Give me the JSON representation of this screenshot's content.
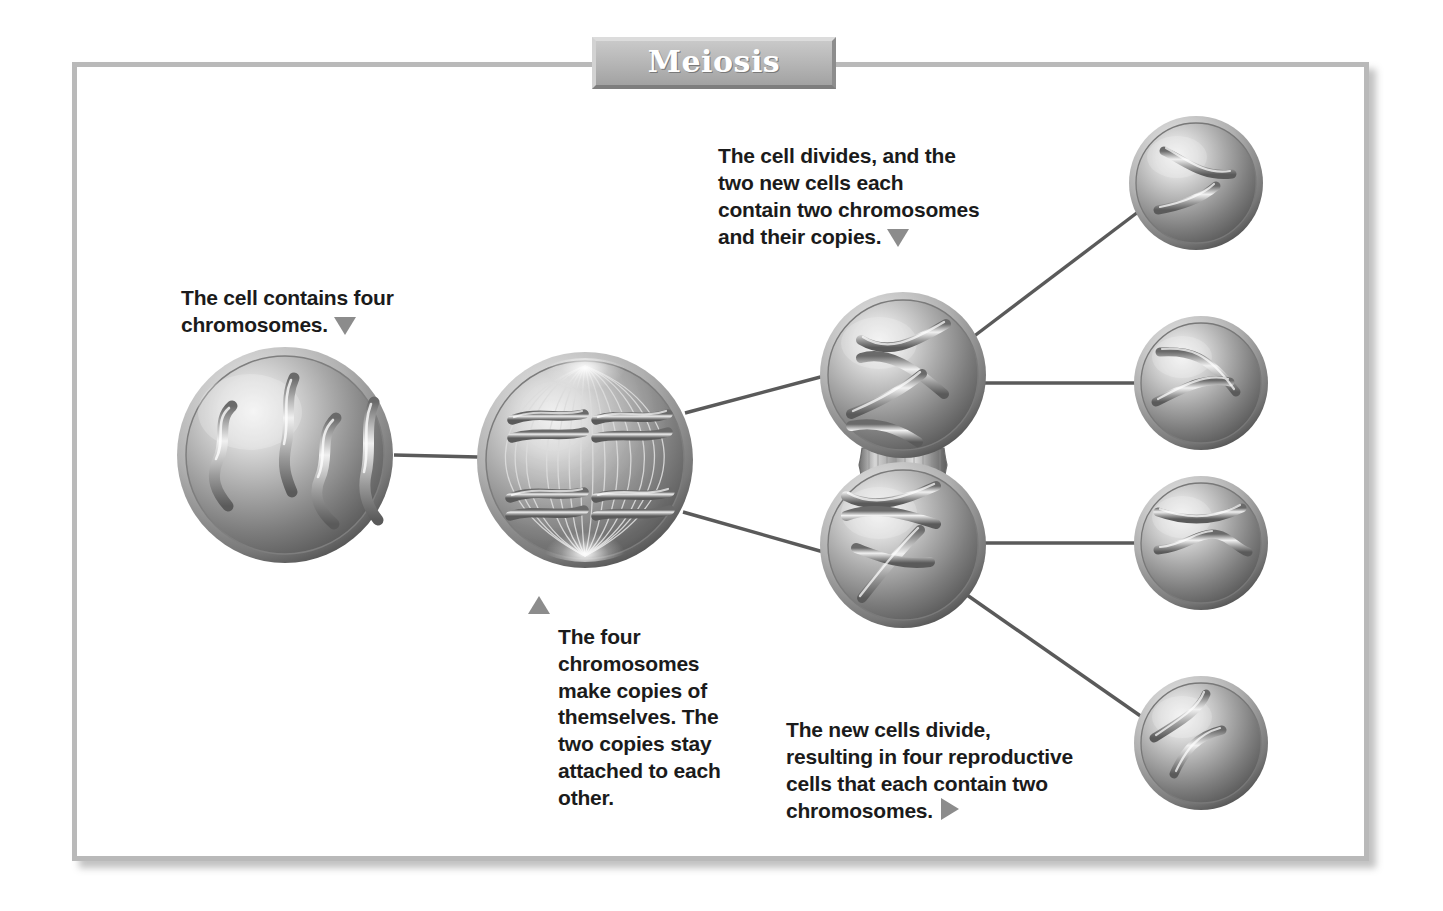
{
  "title": {
    "text": "Meiosis",
    "banner_color": "#b4b4b4",
    "text_color": "#ffffff"
  },
  "frame": {
    "border_color": "#b9b9b9",
    "background": "#ffffff"
  },
  "captions": [
    {
      "id": "cell-contains-four-chromosomes",
      "text": "The cell contains four\nchromosomes.",
      "marker": "triangle-down",
      "marker_position": "end"
    },
    {
      "id": "cell-divides-two-new-cells",
      "text": "The cell divides, and the\ntwo new cells each\ncontain two chromosomes\nand their copies.",
      "marker": "triangle-down",
      "marker_position": "end"
    },
    {
      "id": "four-chromosomes-make-copies",
      "text": "The four\nchromosomes\nmake copies of\nthemselves. The\ntwo copies stay\nattached to each\nother.",
      "marker": "triangle-up",
      "marker_position": "start"
    },
    {
      "id": "new-cells-divide-four-reproductive",
      "text": "The new cells divide,\nresulting in four reproductive\ncells that each contain two\nchromosomes.",
      "marker": "triangle-right",
      "marker_position": "end"
    }
  ],
  "diagram": {
    "type": "process-flow",
    "subject": "Meiosis",
    "marker_color": "#8c8c8c",
    "connector_color": "#5a5a5a",
    "cell_fill_light": "#e2e2e2",
    "cell_fill_mid": "#9a9a9a",
    "cell_fill_dark": "#5f5f5f",
    "stages": [
      {
        "stage": 1,
        "name": "parent-cell",
        "label": "Parent cell with four chromosomes",
        "chromosome_count": 4,
        "cx": 285,
        "cy": 455,
        "r": 108
      },
      {
        "stage": 2,
        "name": "replicated-cell",
        "label": "Cell with four chromosomes duplicated and aligned on spindle",
        "chromosome_count": 4,
        "duplicated": true,
        "spindle": true,
        "cx": 585,
        "cy": 460,
        "r": 108
      },
      {
        "stage": 3,
        "name": "daughter-cell-upper",
        "label": "Upper daughter cell, two chromosomes and their copies",
        "chromosome_count": 2,
        "duplicated": true,
        "cx": 903,
        "cy": 375,
        "r": 83
      },
      {
        "stage": 3,
        "name": "daughter-cell-lower",
        "label": "Lower daughter cell, two chromosomes and their copies",
        "chromosome_count": 2,
        "duplicated": true,
        "cx": 903,
        "cy": 545,
        "r": 83
      },
      {
        "stage": 4,
        "name": "reproductive-cell-1",
        "label": "Reproductive cell 1 with two chromosomes",
        "chromosome_count": 2,
        "cx": 1196,
        "cy": 183,
        "r": 67
      },
      {
        "stage": 4,
        "name": "reproductive-cell-2",
        "label": "Reproductive cell 2 with two chromosomes",
        "chromosome_count": 2,
        "cx": 1201,
        "cy": 383,
        "r": 67
      },
      {
        "stage": 4,
        "name": "reproductive-cell-3",
        "label": "Reproductive cell 3 with two chromosomes",
        "chromosome_count": 2,
        "cx": 1201,
        "cy": 543,
        "r": 67
      },
      {
        "stage": 4,
        "name": "reproductive-cell-4",
        "label": "Reproductive cell 4 with two chromosomes",
        "chromosome_count": 2,
        "cx": 1201,
        "cy": 743,
        "r": 67
      }
    ],
    "connectors": [
      {
        "from": "parent-cell",
        "to": "replicated-cell"
      },
      {
        "from": "replicated-cell",
        "to": "daughter-cell-upper"
      },
      {
        "from": "replicated-cell",
        "to": "daughter-cell-lower"
      },
      {
        "from": "daughter-cell-upper",
        "to": "reproductive-cell-1"
      },
      {
        "from": "daughter-cell-upper",
        "to": "reproductive-cell-2"
      },
      {
        "from": "daughter-cell-lower",
        "to": "reproductive-cell-3"
      },
      {
        "from": "daughter-cell-lower",
        "to": "reproductive-cell-4"
      }
    ]
  }
}
